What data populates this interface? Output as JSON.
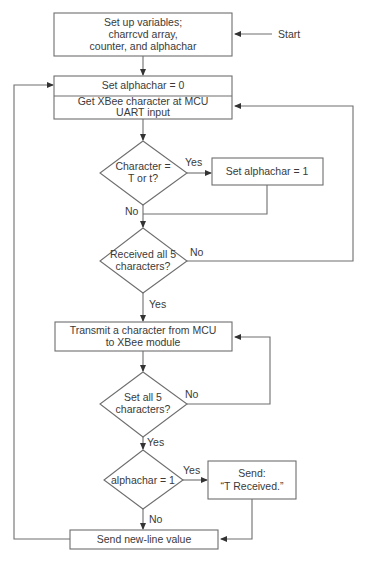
{
  "diagram": {
    "type": "flowchart",
    "colors": {
      "stroke": "#6e6e6e",
      "text": "#3a3a3a",
      "background": "#ffffff"
    },
    "start_label": "Start",
    "nodes": {
      "setup": {
        "shape": "process",
        "lines": [
          "Set up variables;",
          "charrcvd array,",
          "counter, and alphachar"
        ]
      },
      "reset_alphachar": {
        "shape": "process",
        "text": "Set alphachar = 0"
      },
      "get_char": {
        "shape": "process",
        "lines": [
          "Get XBee character at MCU",
          "UART input"
        ]
      },
      "is_t": {
        "shape": "decision",
        "lines": [
          "Character =",
          "T or t?"
        ]
      },
      "set_alphachar": {
        "shape": "process",
        "text": "Set alphachar = 1"
      },
      "received_all": {
        "shape": "decision",
        "lines": [
          "Received all 5",
          "characters?"
        ]
      },
      "transmit": {
        "shape": "process",
        "lines": [
          "Transmit a character from MCU",
          "to XBee module"
        ]
      },
      "sent_all": {
        "shape": "decision",
        "lines": [
          "Set all 5",
          "characters?"
        ]
      },
      "check_alphachar": {
        "shape": "decision",
        "text": "alphachar = 1"
      },
      "send_received": {
        "shape": "process",
        "lines": [
          "Send:",
          "“T Received.”"
        ]
      },
      "send_newline": {
        "shape": "process",
        "text": "Send new-line value"
      }
    },
    "edge_labels": {
      "is_t_yes": "Yes",
      "is_t_no": "No",
      "received_all_no": "No",
      "received_all_yes": "Yes",
      "sent_all_no": "No",
      "sent_all_yes": "Yes",
      "check_alphachar_yes": "Yes",
      "check_alphachar_no": "No"
    },
    "edges": [
      [
        "start",
        "setup"
      ],
      [
        "setup",
        "reset_alphachar"
      ],
      [
        "get_char",
        "is_t"
      ],
      [
        "is_t",
        "set_alphachar",
        "Yes"
      ],
      [
        "is_t",
        "received_all",
        "No"
      ],
      [
        "set_alphachar",
        "received_all"
      ],
      [
        "received_all",
        "get_char",
        "No"
      ],
      [
        "received_all",
        "transmit",
        "Yes"
      ],
      [
        "transmit",
        "sent_all"
      ],
      [
        "sent_all",
        "transmit",
        "No"
      ],
      [
        "sent_all",
        "check_alphachar",
        "Yes"
      ],
      [
        "check_alphachar",
        "send_received",
        "Yes"
      ],
      [
        "check_alphachar",
        "send_newline",
        "No"
      ],
      [
        "send_received",
        "send_newline"
      ],
      [
        "send_newline",
        "reset_alphachar"
      ]
    ]
  }
}
